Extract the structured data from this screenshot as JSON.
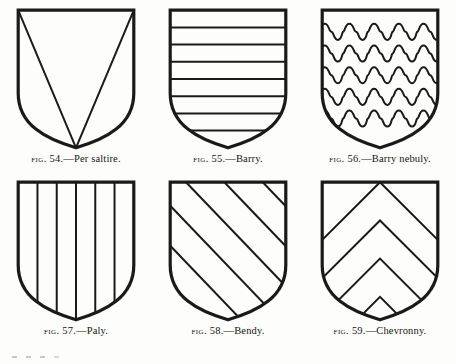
{
  "plate": {
    "background_color": "#fdfdfc",
    "ink_color": "#1a1a1a",
    "columns": 3,
    "rows": 2
  },
  "shield": {
    "outline_stroke_width": 3.2,
    "charge_stroke_width": 2.0,
    "width": 120,
    "height": 142
  },
  "figures": [
    {
      "id": "fig-54",
      "fig_label": "Fig.",
      "number": "54.",
      "dash": "—",
      "term": "Per saltire.",
      "caption": "Fig. 54.—Per saltire.",
      "ordinary": "per-saltire",
      "divisions": 4,
      "description": "Shield divided by a diagonal cross from corner to corner"
    },
    {
      "id": "fig-55",
      "fig_label": "Fig.",
      "number": "55.",
      "dash": "—",
      "term": "Barry.",
      "caption": "Fig. 55.—Barry.",
      "ordinary": "barry",
      "divisions": 8,
      "lines": 7,
      "description": "Shield divided into eight horizontal bars"
    },
    {
      "id": "fig-56",
      "fig_label": "Fig.",
      "number": "56.",
      "dash": "—",
      "term": "Barry nebuly.",
      "caption": "Fig. 56.—Barry nebuly.",
      "ordinary": "barry-nebuly",
      "divisions": 6,
      "lines": 5,
      "lobes_per_line": 5,
      "description": "Horizontal divisions drawn with cloud-like interlocking nebuly lines"
    },
    {
      "id": "fig-57",
      "fig_label": "Fig.",
      "number": "57.",
      "dash": "—",
      "term": "Paly.",
      "caption": "Fig. 57.—Paly.",
      "ordinary": "paly",
      "divisions": 6,
      "lines": 5,
      "description": "Shield divided into six vertical pales"
    },
    {
      "id": "fig-58",
      "fig_label": "Fig.",
      "number": "58.",
      "dash": "—",
      "term": "Bendy.",
      "caption": "Fig. 58.—Bendy.",
      "ordinary": "bendy",
      "divisions": 6,
      "lines": 5,
      "description": "Shield divided by diagonal bands from dexter chief to sinister base"
    },
    {
      "id": "fig-59",
      "fig_label": "Fig.",
      "number": "59.",
      "dash": "—",
      "term": "Chevronny.",
      "caption": "Fig. 59.—Chevronny.",
      "ordinary": "chevronny",
      "divisions": 6,
      "lines": 5,
      "description": "Shield divided into nested chevrons pointing to chief"
    }
  ]
}
